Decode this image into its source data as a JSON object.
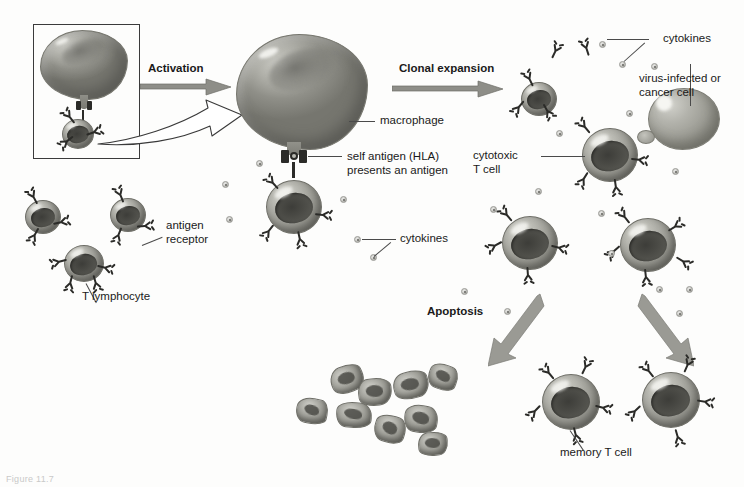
{
  "figure": {
    "caption": "Figure 11.7",
    "background_color": "#fdfdfc",
    "ink_color": "#1a1a1a"
  },
  "process_labels": [
    {
      "id": "activation",
      "text": "Activation"
    },
    {
      "id": "clonal-expansion",
      "text": "Clonal expansion"
    },
    {
      "id": "apoptosis",
      "text": "Apoptosis"
    }
  ],
  "annotations": [
    {
      "id": "t-lymphocyte",
      "text": "T lymphocyte"
    },
    {
      "id": "antigen-receptor",
      "text": "antigen\nreceptor"
    },
    {
      "id": "antigen-receptor-line1",
      "text": "antigen"
    },
    {
      "id": "antigen-receptor-line2",
      "text": "receptor"
    },
    {
      "id": "macrophage",
      "text": "macrophage"
    },
    {
      "id": "self-antigen-line1",
      "text": "self antigen (HLA)"
    },
    {
      "id": "self-antigen-line2",
      "text": "presents an antigen"
    },
    {
      "id": "cytokines-left",
      "text": "cytokines"
    },
    {
      "id": "cytokines-right",
      "text": "cytokines"
    },
    {
      "id": "cytotoxic-t-cell-line1",
      "text": "cytotoxic"
    },
    {
      "id": "cytotoxic-t-cell-line2",
      "text": "T cell"
    },
    {
      "id": "virus-infected-line1",
      "text": "virus-infected or"
    },
    {
      "id": "virus-infected-line2",
      "text": "cancer cell"
    },
    {
      "id": "memory-t-cell",
      "text": "memory T cell"
    }
  ],
  "stages": {
    "resting": {
      "name": "Resting T lymphocytes",
      "count": 3
    },
    "inset": {
      "name": "Antigen presentation inset"
    },
    "activated": {
      "name": "Activated macrophage with T cell"
    },
    "expansion": {
      "name": "Clonally expanded cytotoxic T cells",
      "count": 4
    },
    "apoptotic": {
      "name": "Apoptotic bodies",
      "count": 7
    },
    "memory": {
      "name": "Memory T cells",
      "count": 2
    }
  },
  "palette": {
    "cell_membrane": "#9b9b94",
    "cell_nucleus": "#4c4c47",
    "macrophage": "#8f8f88",
    "receptor": "#2b2b28",
    "arrow_fill": "#8e8e88",
    "leader_line": "#4a4a4a",
    "inset_border": "#3b3b3b"
  }
}
